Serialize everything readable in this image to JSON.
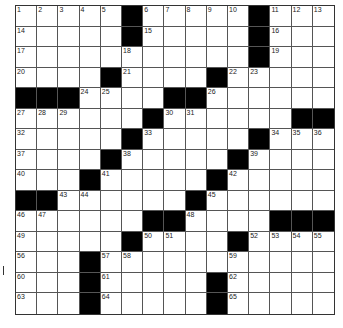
{
  "puzzle": {
    "rows": 15,
    "cols": 15,
    "layout": [
      "11111011111011 1",
      "",
      ""
    ],
    "grid": [
      ".....#.....#...",
      ".....#.....#...",
      "...........#...",
      "....#....#.....",
      "###....##......",
      "......#......##",
      ".....#.....#...",
      "....#.....#....",
      "...#.....#.....",
      "##......#......",
      "......##....###",
      ".....#....#....",
      "...#...........",
      "...#.....#.....",
      "...#.....#....."
    ],
    "numbers": [
      {
        "r": 0,
        "c": 0,
        "n": "1"
      },
      {
        "r": 0,
        "c": 1,
        "n": "2"
      },
      {
        "r": 0,
        "c": 2,
        "n": "3"
      },
      {
        "r": 0,
        "c": 3,
        "n": "4"
      },
      {
        "r": 0,
        "c": 4,
        "n": "5"
      },
      {
        "r": 0,
        "c": 6,
        "n": "6"
      },
      {
        "r": 0,
        "c": 7,
        "n": "7"
      },
      {
        "r": 0,
        "c": 8,
        "n": "8"
      },
      {
        "r": 0,
        "c": 9,
        "n": "9"
      },
      {
        "r": 0,
        "c": 10,
        "n": "10"
      },
      {
        "r": 0,
        "c": 12,
        "n": "11"
      },
      {
        "r": 0,
        "c": 13,
        "n": "12"
      },
      {
        "r": 0,
        "c": 14,
        "n": "13"
      },
      {
        "r": 1,
        "c": 0,
        "n": "14"
      },
      {
        "r": 1,
        "c": 6,
        "n": "15"
      },
      {
        "r": 1,
        "c": 12,
        "n": "16"
      },
      {
        "r": 2,
        "c": 0,
        "n": "17"
      },
      {
        "r": 2,
        "c": 5,
        "n": "18"
      },
      {
        "r": 2,
        "c": 12,
        "n": "19"
      },
      {
        "r": 3,
        "c": 0,
        "n": "20"
      },
      {
        "r": 3,
        "c": 5,
        "n": "21"
      },
      {
        "r": 3,
        "c": 10,
        "n": "22"
      },
      {
        "r": 3,
        "c": 11,
        "n": "23"
      },
      {
        "r": 4,
        "c": 3,
        "n": "24"
      },
      {
        "r": 4,
        "c": 4,
        "n": "25"
      },
      {
        "r": 4,
        "c": 9,
        "n": "26"
      },
      {
        "r": 5,
        "c": 0,
        "n": "27"
      },
      {
        "r": 5,
        "c": 1,
        "n": "28"
      },
      {
        "r": 5,
        "c": 2,
        "n": "29"
      },
      {
        "r": 5,
        "c": 7,
        "n": "30"
      },
      {
        "r": 5,
        "c": 8,
        "n": "31"
      },
      {
        "r": 6,
        "c": 0,
        "n": "32"
      },
      {
        "r": 6,
        "c": 6,
        "n": "33"
      },
      {
        "r": 6,
        "c": 12,
        "n": "34"
      },
      {
        "r": 6,
        "c": 13,
        "n": "35"
      },
      {
        "r": 6,
        "c": 14,
        "n": "36"
      },
      {
        "r": 7,
        "c": 0,
        "n": "37"
      },
      {
        "r": 7,
        "c": 5,
        "n": "38"
      },
      {
        "r": 7,
        "c": 11,
        "n": "39"
      },
      {
        "r": 8,
        "c": 0,
        "n": "40"
      },
      {
        "r": 8,
        "c": 4,
        "n": "41"
      },
      {
        "r": 8,
        "c": 10,
        "n": "42"
      },
      {
        "r": 9,
        "c": 2,
        "n": "43"
      },
      {
        "r": 9,
        "c": 3,
        "n": "44"
      },
      {
        "r": 9,
        "c": 9,
        "n": "45"
      },
      {
        "r": 10,
        "c": 0,
        "n": "46"
      },
      {
        "r": 10,
        "c": 1,
        "n": "47"
      },
      {
        "r": 10,
        "c": 8,
        "n": "48"
      },
      {
        "r": 11,
        "c": 0,
        "n": "49"
      },
      {
        "r": 11,
        "c": 6,
        "n": "50"
      },
      {
        "r": 11,
        "c": 7,
        "n": "51"
      },
      {
        "r": 11,
        "c": 11,
        "n": "52"
      },
      {
        "r": 11,
        "c": 12,
        "n": "53"
      },
      {
        "r": 11,
        "c": 13,
        "n": "54"
      },
      {
        "r": 11,
        "c": 14,
        "n": "55"
      },
      {
        "r": 12,
        "c": 0,
        "n": "56"
      },
      {
        "r": 12,
        "c": 4,
        "n": "57"
      },
      {
        "r": 12,
        "c": 5,
        "n": "58"
      },
      {
        "r": 12,
        "c": 10,
        "n": "59"
      },
      {
        "r": 13,
        "c": 0,
        "n": "60"
      },
      {
        "r": 13,
        "c": 4,
        "n": "61"
      },
      {
        "r": 13,
        "c": 10,
        "n": "62"
      },
      {
        "r": 14,
        "c": 0,
        "n": "63"
      },
      {
        "r": 14,
        "c": 4,
        "n": "64"
      },
      {
        "r": 14,
        "c": 10,
        "n": "65"
      }
    ]
  },
  "colors": {
    "black_square": "#000000",
    "white_square": "#ffffff",
    "grid_line": "#555555"
  }
}
